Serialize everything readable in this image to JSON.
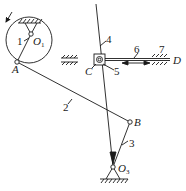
{
  "diagram": {
    "type": "planar-linkage-mechanism",
    "colors": {
      "line": "#1a1a1a",
      "background": "#ffffff"
    },
    "points": {
      "O1": {
        "label": "O",
        "sub": "1"
      },
      "A": {
        "label": "A"
      },
      "B": {
        "label": "B"
      },
      "C": {
        "label": "C"
      },
      "D": {
        "label": "D"
      },
      "O3": {
        "label": "O",
        "sub": "3"
      }
    },
    "links": [
      {
        "id": "1",
        "label": "1",
        "desc": "crank disk"
      },
      {
        "id": "2",
        "label": "2",
        "desc": "connecting rod A-B"
      },
      {
        "id": "3",
        "label": "3",
        "desc": "link B-O3"
      },
      {
        "id": "4",
        "label": "4",
        "desc": "rocker through C to O3"
      },
      {
        "id": "5",
        "label": "5",
        "desc": "slider block at C"
      },
      {
        "id": "6",
        "label": "6",
        "desc": "horizontal rod C-D"
      },
      {
        "id": "7",
        "label": "7",
        "desc": "fixed guide"
      }
    ],
    "annotations": {
      "rotation_arrow": "counterclockwise-arrow",
      "double_arrow": "reciprocating-motion-arrow"
    }
  }
}
